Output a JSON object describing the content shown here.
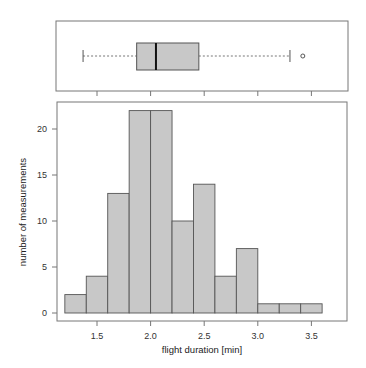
{
  "chart_data": [
    {
      "type": "boxplot",
      "orientation": "horizontal",
      "title": "",
      "xlabel": "",
      "stats": {
        "whisker_low": 1.37,
        "q1": 1.87,
        "median": 2.05,
        "q3": 2.45,
        "whisker_high": 3.3,
        "outliers": [
          3.42
        ]
      },
      "xlim": [
        1.1,
        3.85
      ],
      "x_ticks": [
        1.5,
        2.0,
        2.5,
        3.0,
        3.5
      ]
    },
    {
      "type": "bar",
      "subtype": "histogram",
      "title": "",
      "xlabel": "flight duration [min]",
      "ylabel": "number of measurements",
      "bin_edges": [
        1.2,
        1.4,
        1.6,
        1.8,
        2.0,
        2.2,
        2.4,
        2.6,
        2.8,
        3.0,
        3.2,
        3.4,
        3.6
      ],
      "categories": [
        "1.2-1.4",
        "1.4-1.6",
        "1.6-1.8",
        "1.8-2.0",
        "2.0-2.2",
        "2.2-2.4",
        "2.4-2.6",
        "2.6-2.8",
        "2.8-3.0",
        "3.0-3.2",
        "3.2-3.4",
        "3.4-3.6"
      ],
      "values": [
        2,
        4,
        13,
        22,
        22,
        10,
        14,
        4,
        7,
        1,
        1,
        1
      ],
      "x_ticks": [
        "1.5",
        "2.0",
        "2.5",
        "3.0",
        "3.5"
      ],
      "y_ticks": [
        "0",
        "5",
        "10",
        "15",
        "20"
      ],
      "xlim": [
        1.1,
        3.85
      ],
      "ylim": [
        0,
        23
      ],
      "grid": false,
      "legend": null
    }
  ],
  "colors": {
    "fill": "#c8c8c8",
    "stroke": "#555555",
    "frame": "#777777"
  }
}
